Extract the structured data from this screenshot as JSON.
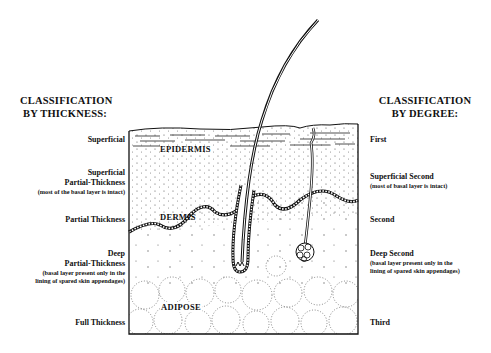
{
  "left_column": {
    "title_line1": "CLASSIFICATION",
    "title_line2": "BY THICKNESS:",
    "items": [
      {
        "label": "Superficial",
        "note": ""
      },
      {
        "label": "Superficial",
        "label2": "Partial-Thickness",
        "note": "(most of the basal layer is intact)"
      },
      {
        "label": "Partial Thickness",
        "note": ""
      },
      {
        "label": "Deep",
        "label2": "Partial-Thickness",
        "note": "(basal layer present only in the",
        "note2": "lining of spared skin appendages)"
      },
      {
        "label": "Full Thickness",
        "note": ""
      }
    ]
  },
  "right_column": {
    "title_line1": "CLASSIFICATION",
    "title_line2": "BY DEGREE:",
    "items": [
      {
        "label": "First",
        "note": ""
      },
      {
        "label": "Superficial Second",
        "note": "(most of basal layer is intact)"
      },
      {
        "label": "Second",
        "note": ""
      },
      {
        "label": "Deep Second",
        "note": "(basal layer present only in the",
        "note2": "lining of spared skin appendages)"
      },
      {
        "label": "Third",
        "note": ""
      }
    ]
  },
  "diagram": {
    "layers": {
      "epidermis": "EPIDERMIS",
      "dermis": "DERMIS",
      "adipose": "ADIPOSE"
    },
    "structures": [
      "hair-shaft",
      "hair-follicle",
      "sweat-gland",
      "basal-layer"
    ]
  }
}
